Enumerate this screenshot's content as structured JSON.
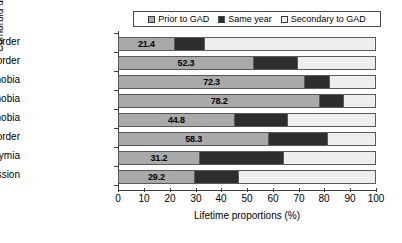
{
  "chart_data": {
    "type": "bar",
    "orientation": "horizontal",
    "stacked": true,
    "title": "",
    "xlabel": "Lifetime proportions (%)",
    "ylabel": "Comorbid disorder",
    "xlim": [
      0,
      100
    ],
    "xticks": [
      0,
      10,
      20,
      30,
      40,
      50,
      60,
      70,
      80,
      90,
      100
    ],
    "grid": false,
    "legend_position": "top",
    "categories": [
      "Drug disorder",
      "Alcohol disorder",
      "Social phobia",
      "Simple phobia",
      "Agoraphobia",
      "Panic disorder",
      "Dysthymia",
      "Major depression"
    ],
    "series": [
      {
        "name": "Prior to GAD",
        "color": "#a9a9a9",
        "values": [
          21.4,
          52.3,
          72.3,
          78.2,
          44.8,
          58.3,
          31.2,
          29.2
        ],
        "labels": [
          "21.4",
          "52.3",
          "72.3",
          "78.2",
          "44.8",
          "58.3",
          "31.2",
          "29.2"
        ]
      },
      {
        "name": "Same year",
        "color": "#2e2e2e",
        "values": [
          12.3,
          17.7,
          10.2,
          9.8,
          21.2,
          23.2,
          33.3,
          17.8
        ],
        "labels": [
          "",
          "",
          "",
          "",
          "",
          "",
          "",
          ""
        ]
      },
      {
        "name": "Secondary to GAD",
        "color": "#eeeeee",
        "values": [
          66.3,
          30.0,
          17.5,
          12.0,
          34.0,
          18.5,
          35.5,
          53.0
        ],
        "labels": [
          "",
          "",
          "",
          "",
          "",
          "",
          "",
          ""
        ]
      }
    ]
  },
  "legend": {
    "items": [
      {
        "label": "Prior to GAD",
        "color": "#a9a9a9"
      },
      {
        "label": "Same year",
        "color": "#2e2e2e"
      },
      {
        "label": "Secondary to GAD",
        "color": "#eeeeee"
      }
    ]
  },
  "axes": {
    "x_title": "Lifetime proportions (%)",
    "y_title": "Comorbid disorder",
    "x_tick_labels": [
      "0",
      "10",
      "20",
      "30",
      "40",
      "50",
      "60",
      "70",
      "80",
      "90",
      "100"
    ],
    "y_tick_labels": [
      "Drug disorder",
      "Alcohol disorder",
      "Social phobia",
      "Simple phobia",
      "Agoraphobia",
      "Panic disorder",
      "Dysthymia",
      "Major depression"
    ]
  }
}
